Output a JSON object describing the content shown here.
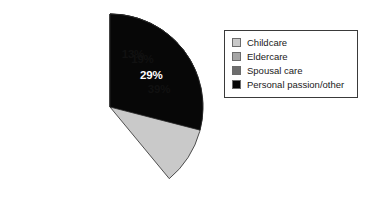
{
  "chart_data": {
    "type": "pie",
    "title": "",
    "subtitle": "",
    "xlabel": "",
    "ylabel": "",
    "grid": false,
    "legend_position": "right",
    "start_angle_deg": 0,
    "direction": "clockwise",
    "categories": [
      "Childcare",
      "Eldercare",
      "Spousal care",
      "Personal passion/other"
    ],
    "values": [
      39,
      19,
      13,
      29
    ],
    "value_unit": "%",
    "data_labels": [
      "39%",
      "19%",
      "13%",
      "29%"
    ],
    "colors": [
      "#c9c9c9",
      "#a5a5a5",
      "#6d6d6d",
      "#070707"
    ],
    "label_text_colors": [
      "#111111",
      "#111111",
      "#111111",
      "#ffffff"
    ],
    "slices": [
      {
        "label": "Childcare",
        "value": 39,
        "data_label": "39%",
        "color": "#c9c9c9",
        "label_color": "#111111"
      },
      {
        "label": "Eldercare",
        "value": 19,
        "data_label": "19%",
        "color": "#a5a5a5",
        "label_color": "#111111"
      },
      {
        "label": "Spousal care",
        "value": 13,
        "data_label": "13%",
        "color": "#6d6d6d",
        "label_color": "#111111"
      },
      {
        "label": "Personal passion/other",
        "value": 29,
        "data_label": "29%",
        "color": "#070707",
        "label_color": "#ffffff"
      }
    ]
  },
  "pie": {
    "slice_0_label": "39%",
    "slice_1_label": "19%",
    "slice_2_label": "13%",
    "slice_3_label": "29%"
  },
  "legend": {
    "items": [
      {
        "label": "Childcare",
        "color": "#c9c9c9"
      },
      {
        "label": "Eldercare",
        "color": "#a5a5a5"
      },
      {
        "label": "Spousal care",
        "color": "#6d6d6d"
      },
      {
        "label": "Personal passion/other",
        "color": "#070707"
      }
    ]
  }
}
